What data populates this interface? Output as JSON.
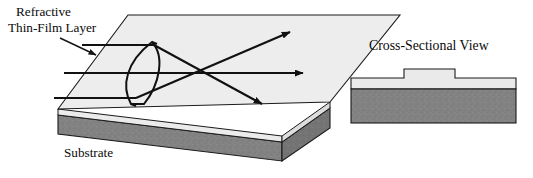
{
  "figure": {
    "title_visible": false,
    "background_color": "#ffffff",
    "labels": {
      "callout_line1": "Refractive",
      "callout_line2": "Thin-Film Layer",
      "substrate": "Substrate",
      "cross_section_title": "Cross-Sectional View"
    },
    "colors": {
      "top_face": "#ededed",
      "thin_film_front": "#e8e8e8",
      "substrate_gray": "#828282",
      "substrate_side_gray": "#6f6f6f",
      "outline": "#1a1a1a",
      "ray": "#111111",
      "text": "#0a0a0a"
    },
    "perspective_view": {
      "name": "3D slab with refractive thin-film lens",
      "description": "Isometric slab: light top surface (thin-film layer) over dark gray substrate; a lens formed in the film refracts three parallel rays to a focus.",
      "rays": [
        {
          "name": "upper-ray",
          "incoming": true,
          "outgoing": true
        },
        {
          "name": "center-ray",
          "incoming": true,
          "outgoing": true
        },
        {
          "name": "lower-ray",
          "incoming": true,
          "outgoing": true
        }
      ],
      "ray_count": 3,
      "focal_point": {
        "x": 208,
        "y": 73
      }
    },
    "cross_section_view": {
      "name": "Cross-sectional view of film on substrate",
      "layers": [
        {
          "name": "thin-film-layer",
          "fill": "#e8e8e8"
        },
        {
          "name": "substrate",
          "fill": "#828282"
        }
      ],
      "feature": "raised lens bump in thin film"
    }
  }
}
